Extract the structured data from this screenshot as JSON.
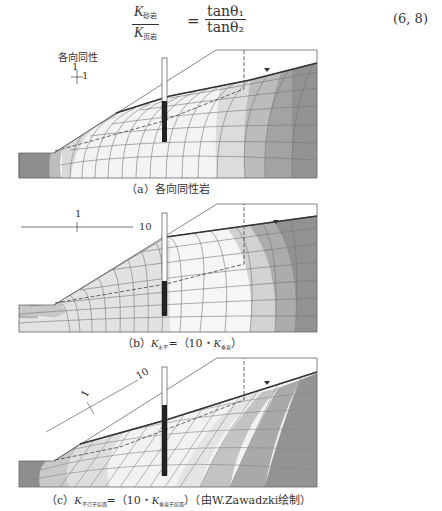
{
  "equation": {
    "numerator_left": "K",
    "numerator_left_sub": "砂岩",
    "denominator_left": "K",
    "denominator_left_sub": "页岩",
    "equals": "=",
    "numerator_right": "tanθ₁",
    "denominator_right": "tanθ₂",
    "number": "(6, 8)"
  },
  "figures": [
    {
      "id": "a",
      "caption_prefix": "（a）",
      "caption": "各向同性岩",
      "anisotropy_label": "各向同性",
      "ratio_vertical": "1",
      "ratio_horizontal": "1"
    },
    {
      "id": "b",
      "caption_prefix": "（b）",
      "caption_k1": "K",
      "caption_k1_sub": "水平",
      "caption_mid": "=（10・",
      "caption_k2": "K",
      "caption_k2_sub": "垂直",
      "caption_end": "）",
      "ratio_vertical": "1",
      "ratio_horizontal": "10"
    },
    {
      "id": "c",
      "caption_prefix": "（c）",
      "caption_k1": "K",
      "caption_k1_sub": "平行于层面",
      "caption_mid": "=（10・",
      "caption_k2": "K",
      "caption_k2_sub": "垂直于层面",
      "caption_end": "）（由W.Zawadzki绘制）",
      "ratio_vertical": "1",
      "ratio_along": "10"
    }
  ],
  "colors": {
    "line": "#555555",
    "water_table": "#333333",
    "shade_light": "#f4f4f4",
    "shade_mid": "#d0d0d0",
    "shade_dark": "#8c8c8c",
    "piezometer_screen": "#222222"
  }
}
